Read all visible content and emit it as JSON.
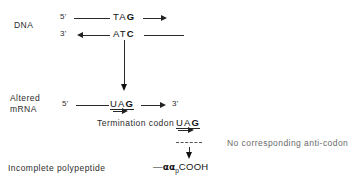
{
  "figure": {
    "background_color": "#ffffff",
    "line_color": "#2a2a2a"
  },
  "labels": {
    "dna": "DNA",
    "altered_line1": "Altered",
    "altered_line2": "mRNA",
    "termination": "Termination codon",
    "no_anticodon": "No corresponding anti-codon",
    "incomplete": "Incomplete polypeptide"
  },
  "dna": {
    "top_strand": {
      "five_prime": "5'",
      "bases_plain": "TA",
      "bases_bold": "G"
    },
    "bottom_strand": {
      "three_prime": "3'",
      "bases_plain": "AT",
      "bases_bold": "C"
    }
  },
  "mrna": {
    "five_prime": "5'",
    "three_prime": "3'",
    "codon_plain": "UA",
    "codon_bold": "G"
  },
  "termination_codon": {
    "codon_plain": "UA",
    "codon_bold": "G"
  },
  "polypeptide": {
    "dash": "—",
    "residues": "αα",
    "subscript": "p",
    "terminus": "COOH"
  }
}
